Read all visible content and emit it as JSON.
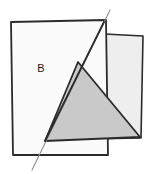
{
  "figure": {
    "background_color": "#ffffff",
    "labels": [
      {
        "id": "region-b",
        "text": "B",
        "x": 41,
        "y": 72
      }
    ],
    "colors": {
      "outline": "#2b2b2b",
      "sheet_front_fill": "#fbfbfb",
      "sheet_back_fill": "#eeeeee",
      "shaded_triangle_fill": "#c9c9c9",
      "fold_line": "#8f8f8f",
      "label_color": "#1a1a1a"
    },
    "shapes": {
      "sheet_back": {
        "name": "back-sheet-rectangle",
        "points": "85,33 143,36 141,138 88,139",
        "fill": "#eeeeee",
        "stroke": "#2b2b2b",
        "stroke_width": 1.6
      },
      "sheet_front": {
        "name": "front-sheet-rectangle",
        "points": "11,22 106,20 108,155 13,155",
        "fill": "#fbfbfb",
        "stroke": "#2b2b2b",
        "stroke_width": 1.8
      },
      "shaded_triangle": {
        "name": "shaded-triangle-region",
        "points": "78,62 45,141 140,137",
        "fill": "#c9c9c9",
        "stroke": "#2b2b2b",
        "stroke_width": 1.8
      },
      "fold_line": {
        "name": "fold-crease-line",
        "x1": 110,
        "y1": 10,
        "x2": 32,
        "y2": 170,
        "stroke": "#8f8f8f",
        "stroke_width": 1.1
      },
      "crease_segment": {
        "name": "crease-over-sheets-segment",
        "x1": 104,
        "y1": 22,
        "x2": 45,
        "y2": 141,
        "stroke": "#2b2b2b",
        "stroke_width": 1.8
      }
    }
  }
}
